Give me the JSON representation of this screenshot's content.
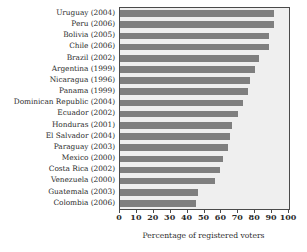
{
  "chart_data": {
    "type": "bar",
    "orientation": "horizontal",
    "title": "",
    "xlabel": "Percentage of registered voters",
    "ylabel": "",
    "xlim": [
      0,
      100
    ],
    "xticks": [
      0,
      10,
      20,
      30,
      40,
      50,
      60,
      70,
      80,
      90,
      100
    ],
    "grid": false,
    "legend": false,
    "bar_color": "#7f7f7f",
    "plot_background": "#efefef",
    "frame_color": "#4a4a4a",
    "categories": [
      "Uruguay (2004)",
      "Peru (2006)",
      "Bolivia (2005)",
      "Chile (2006)",
      "Brazil (2002)",
      "Argentina (1999)",
      "Nicaragua (1996)",
      "Panama (1999)",
      "Dominican Republic (2004)",
      "Ecuador (2002)",
      "Honduras (2001)",
      "El Salvador (2004)",
      "Paraguay (2003)",
      "Mexico (2000)",
      "Costa Rica (2002)",
      "Venezuela (2000)",
      "Guatemala (2003)",
      "Colombia (2006)"
    ],
    "values": [
      91,
      91,
      88,
      88,
      82,
      80,
      77,
      76,
      73,
      70,
      66,
      65,
      64,
      61,
      59,
      56,
      46,
      45
    ]
  }
}
